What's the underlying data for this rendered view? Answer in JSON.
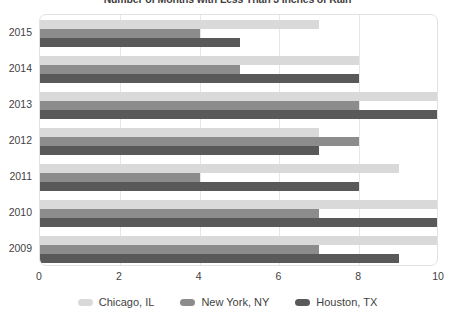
{
  "chart_data": {
    "type": "bar",
    "orientation": "horizontal",
    "title": "Number of Months with Less Than 3 Inches of Rain",
    "xlabel": "",
    "ylabel": "",
    "categories": [
      "2015",
      "2014",
      "2013",
      "2012",
      "2011",
      "2010",
      "2009"
    ],
    "xticks": [
      "0",
      "2",
      "4",
      "6",
      "8",
      "10"
    ],
    "xtick_values": [
      0,
      2,
      4,
      6,
      8,
      10
    ],
    "xlim": [
      0,
      10
    ],
    "grid": true,
    "grid_axis": "x",
    "legend_position": "bottom",
    "series": [
      {
        "name": "Chicago, IL",
        "color": "#d9d9d9",
        "values": [
          7,
          8,
          10,
          7,
          9,
          10,
          10
        ]
      },
      {
        "name": "New York, NY",
        "color": "#8c8c8c",
        "values": [
          4,
          5,
          8,
          8,
          4,
          7,
          7
        ]
      },
      {
        "name": "Houston, TX",
        "color": "#595959",
        "values": [
          5,
          8,
          10,
          7,
          8,
          10,
          9
        ]
      }
    ]
  }
}
